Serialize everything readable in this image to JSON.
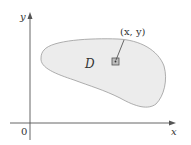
{
  "diagram": {
    "region_label": "D",
    "point_label": "(x, y)",
    "x_axis_label": "x",
    "y_axis_label": "y",
    "origin_label": "0",
    "colors": {
      "region_fill": "#ececec",
      "region_stroke": "#9a9a9a",
      "axis": "#555555",
      "square_fill": "#bdbdbd",
      "square_stroke": "#555555"
    }
  }
}
